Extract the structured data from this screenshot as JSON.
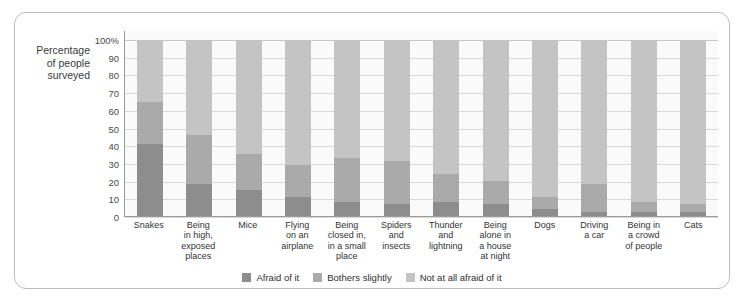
{
  "axis": {
    "y_caption": "Percentage of people surveyed",
    "y_caption_lines": [
      "Percentage",
      "of people",
      "surveyed"
    ],
    "ticks": [
      "100%",
      "90",
      "80",
      "70",
      "60",
      "50",
      "40",
      "30",
      "20",
      "10",
      "0"
    ]
  },
  "legend": {
    "items": [
      {
        "label": "Afraid of it",
        "color": "#8d8d8d",
        "key": "afraid"
      },
      {
        "label": "Bothers slightly",
        "color": "#aaaaaa",
        "key": "slight"
      },
      {
        "label": "Not at all afraid of it",
        "color": "#c4c4c4",
        "key": "none"
      }
    ]
  },
  "chart_data": {
    "type": "bar",
    "stacked": true,
    "title": "",
    "xlabel": "",
    "ylabel": "Percentage of people surveyed",
    "ylim": [
      0,
      100
    ],
    "yticks": [
      0,
      10,
      20,
      30,
      40,
      50,
      60,
      70,
      80,
      90,
      100
    ],
    "grid": true,
    "legend_position": "bottom",
    "categories": [
      "Snakes",
      "Being in high, exposed places",
      "Mice",
      "Flying on an airplane",
      "Being closed in, in a small place",
      "Spiders and insects",
      "Thunder and lightning",
      "Being alone in a house at night",
      "Dogs",
      "Driving a car",
      "Being in a crowd of people",
      "Cats"
    ],
    "category_lines": [
      [
        "Snakes"
      ],
      [
        "Being",
        "in high,",
        "exposed",
        "places"
      ],
      [
        "Mice"
      ],
      [
        "Flying",
        "on an",
        "airplane"
      ],
      [
        "Being",
        "closed in,",
        "in a small",
        "place"
      ],
      [
        "Spiders",
        "and",
        "insects"
      ],
      [
        "Thunder",
        "and",
        "lightning"
      ],
      [
        "Being",
        "alone in",
        "a house",
        "at night"
      ],
      [
        "Dogs"
      ],
      [
        "Driving",
        "a car"
      ],
      [
        "Being in",
        "a crowd",
        "of people"
      ],
      [
        "Cats"
      ]
    ],
    "series": [
      {
        "name": "Afraid of it",
        "color": "#8d8d8d",
        "values": [
          41,
          18,
          15,
          11,
          8,
          7,
          8,
          7,
          4,
          2,
          2,
          2
        ]
      },
      {
        "name": "Bothers slightly",
        "color": "#aaaaaa",
        "values": [
          24,
          28,
          20,
          18,
          25,
          24,
          16,
          13,
          7,
          16,
          6,
          5
        ]
      },
      {
        "name": "Not at all afraid of it",
        "color": "#c4c4c4",
        "values": [
          35,
          54,
          65,
          71,
          67,
          69,
          76,
          80,
          89,
          82,
          92,
          93
        ]
      }
    ],
    "cumulative_tops": {
      "afraid": [
        41,
        18,
        15,
        11,
        8,
        7,
        8,
        7,
        4,
        2,
        2,
        2
      ],
      "afraid_plus_slight": [
        65,
        46,
        35,
        29,
        33,
        31,
        24,
        20,
        11,
        18,
        8,
        7
      ]
    }
  }
}
